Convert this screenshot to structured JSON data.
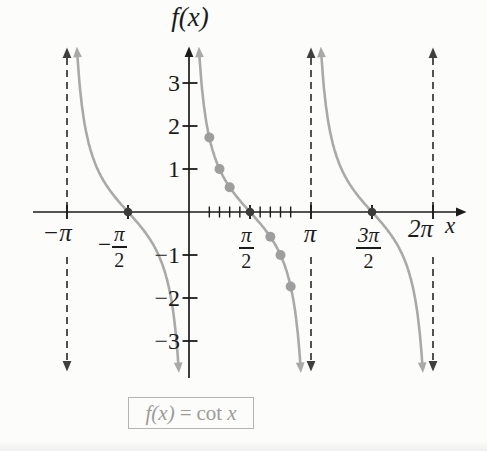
{
  "figure": {
    "background": "#fcfcfa",
    "colors": {
      "axis": "#1b1b1b",
      "curve": "#a9a9a9",
      "point_dot": "#9e9e9e",
      "intercept_dot": "#3a3a3a",
      "asymptote": "#3f3f3f",
      "caption_text": "#9b9b9b",
      "caption_border": "#b3b3b3"
    }
  },
  "labels": {
    "y_axis": "f(x)",
    "x_axis": "x",
    "x_neg_pi": "−π",
    "x_neg_pi_2": {
      "sign": "−",
      "num": "π",
      "den": "2"
    },
    "x_pi_2": {
      "num": "π",
      "den": "2"
    },
    "x_pi": "π",
    "x_3pi_2": {
      "num": "3π",
      "den": "2"
    },
    "x_2pi": "2π",
    "y_p3": "3",
    "y_p2": "2",
    "y_p1": "1",
    "y_n1": "−1",
    "y_n2": "−2",
    "y_n3": "−3",
    "caption": {
      "f": "f(x)",
      "eq": "=",
      "cot": "cot",
      "x": "x"
    }
  },
  "chart_data": {
    "type": "line",
    "title": "f(x) = cot x",
    "function": "f(x) = cot x",
    "xlabel": "x",
    "ylabel": "f(x)",
    "x_range_radians": [
      -3.1416,
      6.2832
    ],
    "y_clip": [
      -3.5,
      3.6
    ],
    "grid": false,
    "y_axis_ticks": [
      3,
      2,
      1,
      -1,
      -2,
      -3
    ],
    "x_axis_ticks": [
      {
        "radians": -3.1416,
        "label": "−π"
      },
      {
        "radians": -1.5708,
        "label": "−π/2"
      },
      {
        "radians": 1.5708,
        "label": "π/2"
      },
      {
        "radians": 3.1416,
        "label": "π"
      },
      {
        "radians": 4.7124,
        "label": "3π/2"
      },
      {
        "radians": 6.2832,
        "label": "2π"
      }
    ],
    "minor_ticks_radians": [
      0.5236,
      0.7854,
      1.0472,
      1.309,
      1.8326,
      2.0944,
      2.3562,
      2.618
    ],
    "asymptotes_radians": [
      -3.1416,
      3.1416,
      6.2832
    ],
    "asymptote_at_zero": "y-axis",
    "branch_intervals_radians": [
      [
        -3.1416,
        0
      ],
      [
        0,
        3.1416
      ],
      [
        3.1416,
        6.2832
      ]
    ],
    "plotted_points": [
      {
        "x_label": "π/6",
        "x": 0.5236,
        "y": 1.7321
      },
      {
        "x_label": "π/4",
        "x": 0.7854,
        "y": 1
      },
      {
        "x_label": "π/3",
        "x": 1.0472,
        "y": 0.5774
      },
      {
        "x_label": "2π/3",
        "x": 2.0944,
        "y": -0.5774
      },
      {
        "x_label": "3π/4",
        "x": 2.3562,
        "y": -1
      },
      {
        "x_label": "5π/6",
        "x": 2.618,
        "y": -1.7321
      }
    ],
    "x_intercepts_radians": [
      -1.5708,
      1.5708,
      4.7124
    ]
  }
}
